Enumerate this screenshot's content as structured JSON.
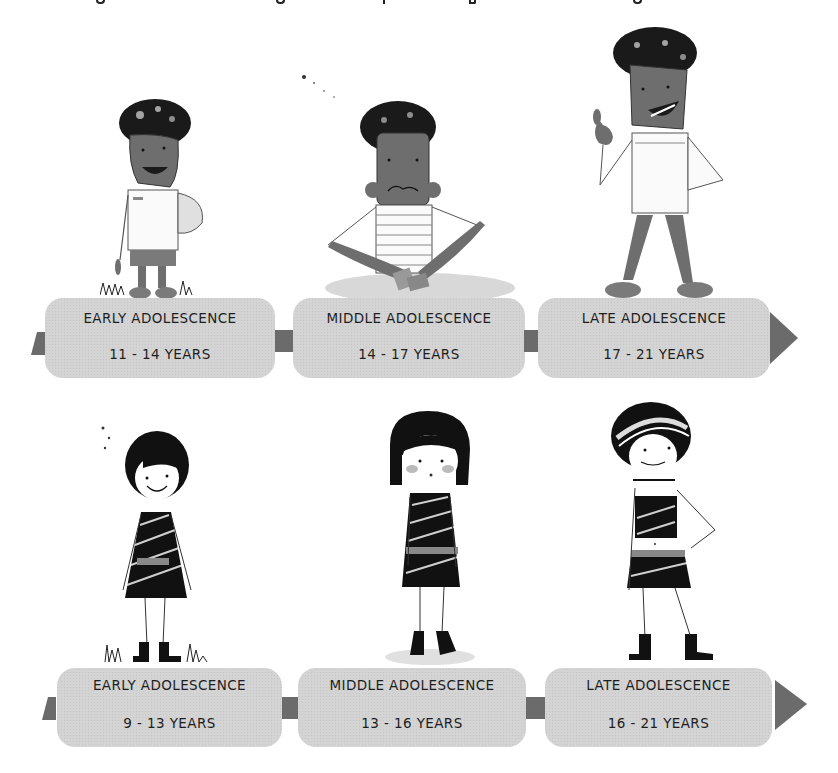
{
  "header": {
    "clipped_caption_note": "partially cropped text line at top edge (unreadable)"
  },
  "timelines": [
    {
      "row": "boys",
      "stages": [
        {
          "name": "EARLY ADOLESCENCE",
          "ages": "11 - 14 YEARS",
          "figure": "boy-holding-ball-smiling"
        },
        {
          "name": "MIDDLE ADOLESCENCE",
          "ages": "14 - 17 YEARS",
          "figure": "boy-sitting-cross-legged-worried"
        },
        {
          "name": "LATE ADOLESCENCE",
          "ages": "17 - 21 YEARS",
          "figure": "boy-thumbs-up-standing"
        }
      ]
    },
    {
      "row": "girls",
      "stages": [
        {
          "name": "EARLY ADOLESCENCE",
          "ages": "9 - 13 YEARS",
          "figure": "girl-standing-smiling"
        },
        {
          "name": "MIDDLE ADOLESCENCE",
          "ages": "13 - 16 YEARS",
          "figure": "girl-shy-blushing"
        },
        {
          "name": "LATE ADOLESCENCE",
          "ages": "16 - 21 YEARS",
          "figure": "girl-hand-on-hip-confident"
        }
      ]
    }
  ],
  "colors": {
    "box_fill": "#d4d4d4",
    "connector": "#6b6b6b",
    "text": "#1e1e1e",
    "skin": "#6e6e6e",
    "hair": "#1a1a1a"
  }
}
